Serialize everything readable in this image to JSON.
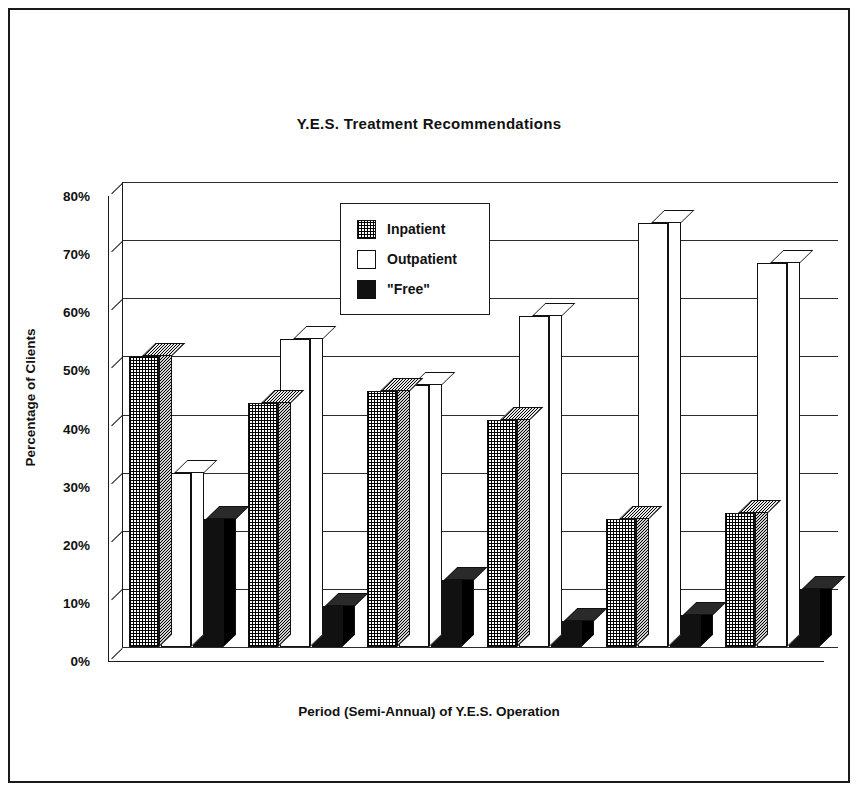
{
  "figure": {
    "title": "Y.E.S. Treatment Recommendations"
  },
  "axes": {
    "ylabel": "Percentage of Clients",
    "xlabel": "Period (Semi-Annual) of Y.E.S. Operation",
    "yticks": [
      "0%",
      "10%",
      "20%",
      "30%",
      "40%",
      "50%",
      "60%",
      "70%",
      "80%"
    ]
  },
  "legend": {
    "items": [
      {
        "label": "Inpatient",
        "swatch": "crosshatch-swatch"
      },
      {
        "label": "Outpatient",
        "swatch": "white-swatch"
      },
      {
        "label": "\"Free\"",
        "swatch": "black-swatch"
      }
    ]
  },
  "chart_data": {
    "type": "bar",
    "title": "Y.E.S. Treatment Recommendations",
    "xlabel": "Period (Semi-Annual) of Y.E.S. Operation",
    "ylabel": "Percentage of Clients",
    "ylim": [
      0,
      80
    ],
    "ytick_step": 10,
    "grid": true,
    "legend_position": "inside-upper-center",
    "style": "3d-grouped-bars",
    "categories": [
      "4/89-9/89",
      "10/89-3/90",
      "4/90-9/90",
      "10/90-3/91",
      "4/91-9/91",
      "10/91-3/92"
    ],
    "series": [
      {
        "name": "Inpatient",
        "values": [
          50,
          42,
          44,
          39,
          22,
          23
        ]
      },
      {
        "name": "Outpatient",
        "values": [
          30,
          53,
          45,
          57,
          73,
          66
        ]
      },
      {
        "name": "\"Free\"",
        "values": [
          22,
          7,
          11.5,
          4.5,
          5.5,
          10
        ]
      }
    ]
  }
}
